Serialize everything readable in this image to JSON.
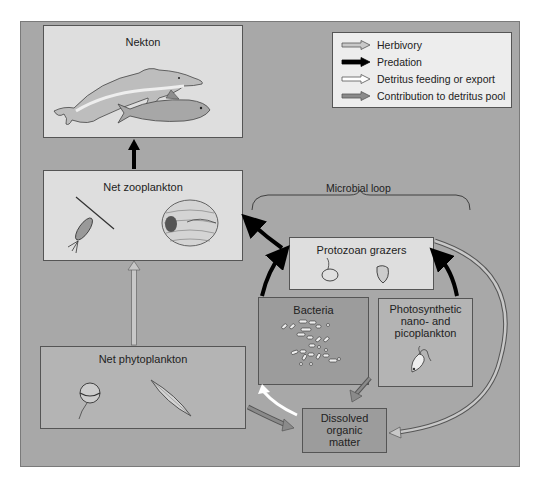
{
  "legend": {
    "items": [
      {
        "label": "Herbivory",
        "arrow": "gray-outline"
      },
      {
        "label": "Predation",
        "arrow": "black-solid"
      },
      {
        "label": "Detritus feeding or export",
        "arrow": "white-outline"
      },
      {
        "label": "Contribution to detritus pool",
        "arrow": "dark-gray"
      }
    ]
  },
  "nodes": {
    "nekton": {
      "label": "Nekton",
      "icons": [
        "dolphin-icon",
        "fish-icon"
      ]
    },
    "net_zooplankton": {
      "label": "Net zooplankton",
      "icons": [
        "copepod-icon",
        "larvacean-icon"
      ]
    },
    "net_phytoplankton": {
      "label": "Net phytoplankton",
      "icons": [
        "dinoflagellate-icon",
        "diatom-icon"
      ]
    },
    "protozoan_grazers": {
      "label": "Protozoan grazers",
      "icons": [
        "ciliate-icon",
        "tintinnid-icon"
      ]
    },
    "bacteria": {
      "label": "Bacteria",
      "icons": [
        "bacteria-cluster-icon"
      ]
    },
    "photosynthetic": {
      "label_lines": [
        "Photosynthetic",
        "nano- and",
        "picoplankton"
      ],
      "icons": [
        "flagellate-icon"
      ]
    },
    "dom": {
      "label_lines": [
        "Dissolved",
        "organic",
        "matter"
      ]
    }
  },
  "microbial_loop": {
    "label": "Microbial loop"
  },
  "edges": [
    {
      "from": "Net zooplankton",
      "to": "Nekton",
      "type": "Predation"
    },
    {
      "from": "Net phytoplankton",
      "to": "Net zooplankton",
      "type": "Herbivory"
    },
    {
      "from": "Protozoan grazers",
      "to": "Net zooplankton",
      "type": "Predation"
    },
    {
      "from": "Bacteria",
      "to": "Protozoan grazers",
      "type": "Predation"
    },
    {
      "from": "Photosynthetic nano- and picoplankton",
      "to": "Protozoan grazers",
      "type": "Predation"
    },
    {
      "from": "Protozoan grazers",
      "to": "Dissolved organic matter",
      "type": "Contribution to detritus pool"
    },
    {
      "from": "Bacteria",
      "to": "Dissolved organic matter",
      "type": "Contribution to detritus pool"
    },
    {
      "from": "Net phytoplankton",
      "to": "Dissolved organic matter",
      "type": "Contribution to detritus pool"
    },
    {
      "from": "Dissolved organic matter",
      "to": "Bacteria",
      "type": "Detritus feeding or export"
    }
  ],
  "colors": {
    "panel": "#a8a8a8",
    "light_box": "#dedede",
    "bacteria_box": "#9c9c9c",
    "predation": "#000000",
    "herbivory": "#c8c8c8",
    "detritus_feeding": "#ffffff",
    "detritus_contribution": "#8a8a8a"
  }
}
